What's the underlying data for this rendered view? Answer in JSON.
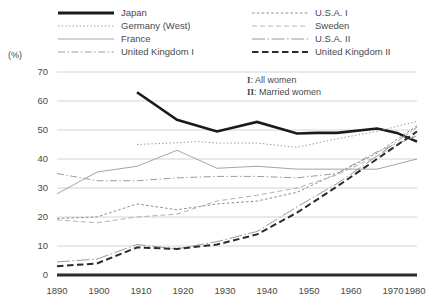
{
  "chart_data": {
    "type": "line",
    "title": "",
    "xlabel": "",
    "ylabel": "(%)",
    "unit_label": "(%)",
    "xlim": [
      1890,
      1980
    ],
    "ylim": [
      0,
      70
    ],
    "x_ticks": [
      "1890",
      "1900",
      "1910",
      "1920",
      "1930",
      "1940",
      "1950",
      "1960",
      "1970",
      "1980"
    ],
    "y_ticks": [
      "0",
      "10",
      "20",
      "30",
      "40",
      "50",
      "60",
      "70"
    ],
    "grid": "horizontal",
    "legend_position": "top",
    "annotations": [
      {
        "marker": "I",
        "text": ": All women"
      },
      {
        "marker": "II",
        "text": ": Married women"
      }
    ],
    "series": [
      {
        "name": "Japan",
        "style": "solid-thick",
        "color": "#1a1a1a",
        "width": 2.6,
        "x": [
          1910,
          1920,
          1930,
          1940,
          1950,
          1955,
          1960,
          1970,
          1975,
          1980
        ],
        "values": [
          63.0,
          53.5,
          49.5,
          52.8,
          48.8,
          49.0,
          49.0,
          50.5,
          49.0,
          46.0
        ]
      },
      {
        "name": "Germany (West)",
        "style": "dotted",
        "color": "#9a9a9a",
        "width": 1.0,
        "x": [
          1910,
          1920,
          1925,
          1930,
          1940,
          1950,
          1960,
          1970,
          1980
        ],
        "values": [
          45.0,
          45.6,
          46.0,
          45.5,
          45.5,
          44.0,
          47.0,
          49.5,
          53.0
        ]
      },
      {
        "name": "France",
        "style": "solid-thin",
        "color": "#a5a5a5",
        "width": 1.0,
        "x": [
          1890,
          1900,
          1910,
          1920,
          1930,
          1940,
          1950,
          1960,
          1970,
          1980
        ],
        "values": [
          28.0,
          35.5,
          37.5,
          43.0,
          36.8,
          37.5,
          36.5,
          36.5,
          36.5,
          40.0
        ]
      },
      {
        "name": "United Kingdom I",
        "style": "dash-dot",
        "color": "#9d9d9d",
        "width": 1.0,
        "x": [
          1890,
          1900,
          1910,
          1920,
          1930,
          1940,
          1950,
          1960,
          1970,
          1980
        ],
        "values": [
          35.0,
          32.5,
          32.5,
          33.5,
          34.0,
          34.0,
          33.5,
          35.0,
          42.5,
          48.0
        ]
      },
      {
        "name": "U.S.A. I",
        "style": "fine-dash",
        "color": "#8e8e8e",
        "width": 1.0,
        "x": [
          1890,
          1900,
          1910,
          1920,
          1930,
          1940,
          1950,
          1960,
          1970,
          1980
        ],
        "values": [
          19.5,
          20.0,
          24.5,
          22.5,
          24.5,
          25.5,
          28.5,
          35.0,
          42.0,
          51.5
        ]
      },
      {
        "name": "Sweden",
        "style": "dash",
        "color": "#b2b2b2",
        "width": 1.0,
        "x": [
          1890,
          1900,
          1910,
          1920,
          1930,
          1940,
          1950,
          1960,
          1970,
          1980
        ],
        "values": [
          19.0,
          18.0,
          20.0,
          21.0,
          25.5,
          27.5,
          30.0,
          34.5,
          41.0,
          48.5
        ]
      },
      {
        "name": "U.S.A. II",
        "style": "long-dash-dot",
        "color": "#9a9a9a",
        "width": 1.0,
        "x": [
          1890,
          1900,
          1910,
          1920,
          1930,
          1940,
          1950,
          1960,
          1970,
          1980
        ],
        "values": [
          4.5,
          5.5,
          10.5,
          9.0,
          11.5,
          15.0,
          23.5,
          31.5,
          41.0,
          51.0
        ]
      },
      {
        "name": "United Kingdom II",
        "style": "bold-dash",
        "color": "#2b2b2b",
        "width": 2.0,
        "x": [
          1890,
          1900,
          1910,
          1920,
          1930,
          1940,
          1950,
          1960,
          1970,
          1980
        ],
        "values": [
          3.0,
          4.0,
          9.5,
          9.0,
          10.5,
          14.0,
          21.5,
          30.5,
          40.0,
          49.5
        ]
      }
    ],
    "legend": {
      "left_column": [
        "Japan",
        "Germany (West)",
        "France",
        "United Kingdom I"
      ],
      "right_column": [
        "U.S.A. I",
        "Sweden",
        "U.S.A. II",
        "United Kingdom II"
      ]
    }
  }
}
